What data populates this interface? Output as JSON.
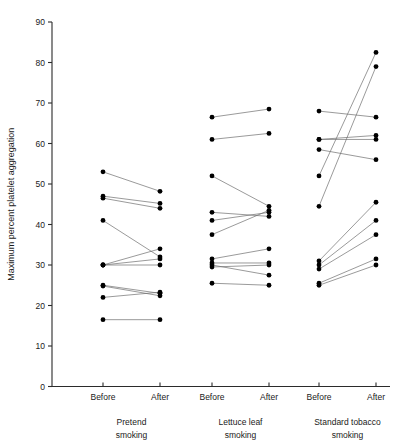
{
  "chart_data": {
    "type": "line",
    "title": "",
    "subtitle": "",
    "xlabel": "",
    "ylabel": "Maximum percent platelet aggregation",
    "ylim": [
      0,
      90
    ],
    "ytick_values": [
      0,
      10,
      20,
      30,
      40,
      50,
      60,
      70,
      80,
      90
    ],
    "ytick_labels": [
      "0",
      "10",
      "20",
      "30",
      "40",
      "50",
      "60",
      "70",
      "80",
      "90"
    ],
    "grid": false,
    "legend": "none",
    "condition_tick_labels": [
      "Before",
      "After"
    ],
    "groups": [
      {
        "name": "Pretend smoking",
        "label_line1": "Pretend",
        "label_line2": "smoking",
        "pairs": [
          {
            "before": 53.0,
            "after": 48.2
          },
          {
            "before": 47.0,
            "after": 45.2
          },
          {
            "before": 46.5,
            "after": 44.0
          },
          {
            "before": 41.0,
            "after": 32.0
          },
          {
            "before": 30.0,
            "after": 34.0
          },
          {
            "before": 30.0,
            "after": 31.5
          },
          {
            "before": 30.0,
            "after": 30.0
          },
          {
            "before": 25.0,
            "after": 23.0
          },
          {
            "before": 24.8,
            "after": 22.4
          },
          {
            "before": 22.0,
            "after": 23.3
          },
          {
            "before": 16.5,
            "after": 16.5
          }
        ]
      },
      {
        "name": "Lettuce leaf smoking",
        "label_line1": "Lettuce leaf",
        "label_line2": "smoking",
        "pairs": [
          {
            "before": 66.5,
            "after": 68.5
          },
          {
            "before": 61.0,
            "after": 62.5
          },
          {
            "before": 52.0,
            "after": 44.5
          },
          {
            "before": 43.0,
            "after": 42.0
          },
          {
            "before": 41.0,
            "after": 43.0
          },
          {
            "before": 37.5,
            "after": 43.5
          },
          {
            "before": 31.5,
            "after": 34.0
          },
          {
            "before": 30.5,
            "after": 30.5
          },
          {
            "before": 30.0,
            "after": 27.5
          },
          {
            "before": 29.5,
            "after": 30.0
          },
          {
            "before": 25.5,
            "after": 25.0
          }
        ]
      },
      {
        "name": "Standard tobacco smoking",
        "label_line1": "Standard tobacco",
        "label_line2": "smoking",
        "pairs": [
          {
            "before": 68.0,
            "after": 66.5
          },
          {
            "before": 61.0,
            "after": 62.0
          },
          {
            "before": 61.0,
            "after": 61.0
          },
          {
            "before": 58.5,
            "after": 56.0
          },
          {
            "before": 52.0,
            "after": 82.5
          },
          {
            "before": 44.5,
            "after": 79.0
          },
          {
            "before": 31.0,
            "after": 45.5
          },
          {
            "before": 30.0,
            "after": 41.0
          },
          {
            "before": 29.0,
            "after": 37.5
          },
          {
            "before": 25.5,
            "after": 31.5
          },
          {
            "before": 25.0,
            "after": 30.0
          }
        ]
      }
    ]
  }
}
